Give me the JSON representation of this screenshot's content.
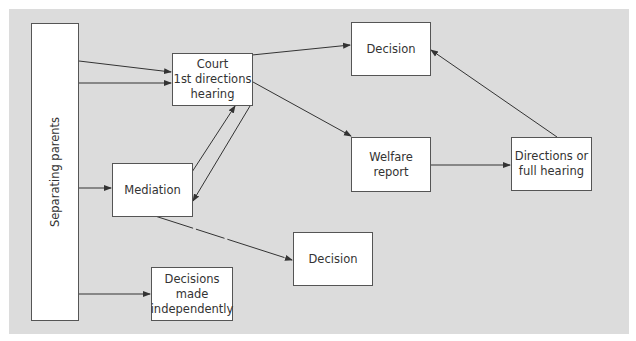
{
  "diagram": {
    "nodes": {
      "separating_parents": "Separating parents",
      "court": "Court\n1st directions\nhearing",
      "decision_top": "Decision",
      "welfare": "Welfare\nreport",
      "directions": "Directions or\nfull hearing",
      "mediation": "Mediation",
      "decision_bottom": "Decision",
      "independent": "Decisions\nmade\nindependently"
    },
    "edges": [
      {
        "from": "Separating parents",
        "to": "Court 1st directions hearing"
      },
      {
        "from": "Separating parents",
        "to": "Court 1st directions hearing"
      },
      {
        "from": "Separating parents",
        "to": "Mediation"
      },
      {
        "from": "Separating parents",
        "to": "Decisions made independently"
      },
      {
        "from": "Mediation",
        "to": "Court 1st directions hearing"
      },
      {
        "from": "Court 1st directions hearing",
        "to": "Mediation"
      },
      {
        "from": "Court 1st directions hearing",
        "to": "Decision"
      },
      {
        "from": "Court 1st directions hearing",
        "to": "Welfare report"
      },
      {
        "from": "Welfare report",
        "to": "Directions or full hearing"
      },
      {
        "from": "Directions or full hearing",
        "to": "Decision"
      },
      {
        "from": "Mediation",
        "to": "Decision",
        "style": "dashed"
      }
    ],
    "colors": {
      "panel": "#dcdcdc",
      "box": "#ffffff",
      "stroke": "#333333"
    }
  }
}
